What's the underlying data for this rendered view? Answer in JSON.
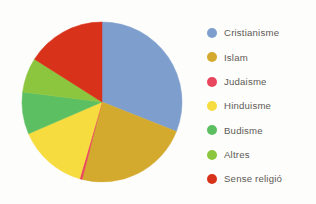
{
  "chart_data": {
    "type": "pie",
    "title": "",
    "subtitle": "",
    "xlabel": "",
    "ylabel": "",
    "legend_position": "right",
    "grid": false,
    "start_angle_deg": 0,
    "direction": "clockwise",
    "categories": [
      "Cristianisme",
      "Islam",
      "Judaisme",
      "Hinduisme",
      "Budisme",
      "Altres",
      "Sense religió"
    ],
    "values": [
      31,
      23,
      0.5,
      14,
      8.5,
      7,
      16
    ],
    "colors": [
      "#7e9fce",
      "#d4aa2e",
      "#e8465c",
      "#f7dc3f",
      "#5cbf62",
      "#8cc63f",
      "#d9321a"
    ],
    "slices": [
      {
        "label": "Cristianisme",
        "value": 31,
        "color": "#7e9fce"
      },
      {
        "label": "Islam",
        "value": 23,
        "color": "#d4aa2e"
      },
      {
        "label": "Judaisme",
        "value": 0.5,
        "color": "#e8465c"
      },
      {
        "label": "Hinduisme",
        "value": 14,
        "color": "#f7dc3f"
      },
      {
        "label": "Budisme",
        "value": 8.5,
        "color": "#5cbf62"
      },
      {
        "label": "Altres",
        "value": 7,
        "color": "#8cc63f"
      },
      {
        "label": "Sense religió",
        "value": 16,
        "color": "#d9321a"
      }
    ]
  },
  "legend": {
    "items": [
      {
        "label": "Cristianisme",
        "color": "#7e9fce",
        "swatch_name": "legend-swatch-cristianisme"
      },
      {
        "label": "Islam",
        "color": "#d4aa2e",
        "swatch_name": "legend-swatch-islam"
      },
      {
        "label": "Judaisme",
        "color": "#e8465c",
        "swatch_name": "legend-swatch-judaisme"
      },
      {
        "label": "Hinduisme",
        "color": "#f7dc3f",
        "swatch_name": "legend-swatch-hinduisme"
      },
      {
        "label": "Budisme",
        "color": "#5cbf62",
        "swatch_name": "legend-swatch-budisme"
      },
      {
        "label": "Altres",
        "color": "#8cc63f",
        "swatch_name": "legend-swatch-altres"
      },
      {
        "label": "Sense religió",
        "color": "#d9321a",
        "swatch_name": "legend-swatch-sense-religio"
      }
    ]
  }
}
